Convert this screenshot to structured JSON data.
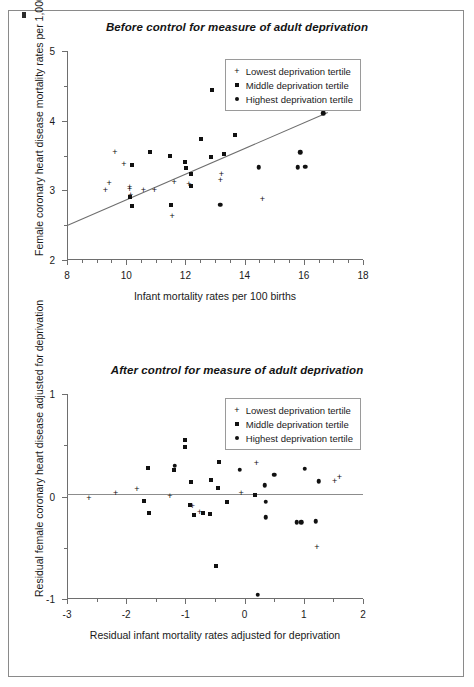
{
  "figure": {
    "background": "#ffffff",
    "border_color": "#8a8a8a",
    "ink_color": "#111111",
    "axis_color": "#6e6e6e"
  },
  "panels": [
    {
      "id": "top",
      "title": "Before control for measure of adult deprivation",
      "xlabel": "Infant mortality rates per 100 births",
      "ylabel": "Female coronary heart disease mortality rates per 1,000",
      "xticks": [
        8,
        10,
        12,
        14,
        16,
        18
      ],
      "yticks": [
        2,
        3,
        4,
        5
      ],
      "xlim": [
        8,
        18
      ],
      "ylim": [
        2,
        5
      ]
    },
    {
      "id": "bottom",
      "title": "After control for measure of adult deprivation",
      "xlabel": "Residual infant mortality rates adjusted for deprivation",
      "ylabel": "Residual female coronary heart disease adjusted for deprivation",
      "xticks": [
        -3,
        -2,
        -1,
        0,
        1,
        2
      ],
      "yticks": [
        1,
        0,
        -1
      ],
      "xlim": [
        -3,
        2
      ],
      "ylim": [
        -1,
        1
      ]
    }
  ],
  "legend": {
    "position": "top-right",
    "entries": [
      {
        "marker": "plus",
        "label": "Lowest deprivation tertile"
      },
      {
        "marker": "square",
        "label": "Middle deprivation tertile"
      },
      {
        "marker": "circle",
        "label": "Highest deprivation tertile"
      }
    ]
  },
  "chart_data": [
    {
      "type": "scatter",
      "panel": "top",
      "title": "Before control for measure of adult deprivation",
      "xlabel": "Infant mortality rates per 100 births",
      "ylabel": "Female coronary heart disease mortality rates per 1,000",
      "xlim": [
        8,
        18
      ],
      "ylim": [
        2,
        5
      ],
      "xticks": [
        8,
        10,
        12,
        14,
        16,
        18
      ],
      "yticks": [
        2,
        3,
        4,
        5
      ],
      "xtick_minor_step": 0.5,
      "ytick_minor_step": 0.5,
      "grid": false,
      "legend_position": "top-right",
      "trendline": {
        "x": [
          8.0,
          16.8
        ],
        "y": [
          2.5,
          4.12
        ]
      },
      "series": [
        {
          "name": "Lowest deprivation tertile",
          "marker": "plus",
          "points": [
            [
              9.3,
              2.99
            ],
            [
              9.42,
              3.09
            ],
            [
              9.62,
              3.54
            ],
            [
              9.92,
              3.37
            ],
            [
              10.12,
              3.04
            ],
            [
              10.12,
              3.0
            ],
            [
              10.15,
              2.92
            ],
            [
              10.58,
              2.99
            ],
            [
              10.95,
              2.99
            ],
            [
              11.55,
              2.62
            ],
            [
              11.62,
              3.11
            ],
            [
              12.12,
              3.07
            ],
            [
              13.22,
              3.22
            ],
            [
              13.18,
              3.14
            ],
            [
              14.6,
              2.86
            ]
          ]
        },
        {
          "name": "Middle deprivation tertile",
          "marker": "square",
          "points": [
            [
              10.12,
              2.9
            ],
            [
              10.2,
              3.36
            ],
            [
              10.18,
              2.77
            ],
            [
              10.82,
              3.55
            ],
            [
              11.48,
              3.5
            ],
            [
              11.52,
              2.79
            ],
            [
              12.0,
              3.4
            ],
            [
              12.02,
              3.32
            ],
            [
              12.18,
              3.23
            ],
            [
              12.2,
              3.06
            ],
            [
              12.52,
              3.74
            ],
            [
              12.88,
              3.48
            ],
            [
              12.9,
              4.44
            ],
            [
              13.32,
              3.52
            ],
            [
              13.68,
              3.8
            ]
          ]
        },
        {
          "name": "Highest deprivation tertile",
          "marker": "circle",
          "points": [
            [
              13.18,
              2.79
            ],
            [
              14.28,
              4.33
            ],
            [
              14.48,
              3.33
            ],
            [
              15.42,
              4.49
            ],
            [
              15.45,
              4.37
            ],
            [
              15.48,
              4.22
            ],
            [
              15.5,
              4.19
            ],
            [
              15.8,
              3.33
            ],
            [
              15.88,
              3.55
            ],
            [
              16.05,
              3.34
            ],
            [
              16.08,
              4.67
            ],
            [
              16.65,
              4.11
            ]
          ]
        }
      ]
    },
    {
      "type": "scatter",
      "panel": "bottom",
      "title": "After control for measure of adult deprivation",
      "xlabel": "Residual infant mortality rates adjusted for deprivation",
      "ylabel": "Residual female coronary heart disease adjusted for deprivation",
      "xlim": [
        -3,
        2
      ],
      "ylim": [
        -1,
        1
      ],
      "xticks": [
        -3,
        -2,
        -1,
        0,
        1,
        2
      ],
      "yticks": [
        1,
        0,
        -1
      ],
      "xtick_minor_step": 0.5,
      "ytick_minor_step": 0.5,
      "grid": false,
      "legend_position": "top-right",
      "zeroline": 0.02,
      "series": [
        {
          "name": "Lowest deprivation tertile",
          "marker": "plus",
          "points": [
            [
              -2.63,
              -0.02
            ],
            [
              -2.18,
              0.02
            ],
            [
              -1.82,
              0.06
            ],
            [
              -1.26,
              0.0
            ],
            [
              -0.88,
              -0.1
            ],
            [
              -0.76,
              -0.16
            ],
            [
              -0.05,
              0.74
            ],
            [
              -0.06,
              0.02
            ],
            [
              0.2,
              0.32
            ],
            [
              1.22,
              -0.5
            ],
            [
              1.52,
              0.14
            ],
            [
              1.6,
              0.18
            ]
          ]
        },
        {
          "name": "Middle deprivation tertile",
          "marker": "square",
          "points": [
            [
              -1.7,
              -0.04
            ],
            [
              -1.64,
              0.28
            ],
            [
              -1.62,
              -0.16
            ],
            [
              -1.19,
              0.26
            ],
            [
              -1.0,
              0.55
            ],
            [
              -1.0,
              0.48
            ],
            [
              -0.9,
              0.14
            ],
            [
              -0.92,
              -0.08
            ],
            [
              -0.86,
              -0.18
            ],
            [
              -0.7,
              -0.16
            ],
            [
              -0.58,
              -0.17
            ],
            [
              -0.56,
              0.16
            ],
            [
              -0.43,
              0.34
            ],
            [
              -0.45,
              0.08
            ],
            [
              -0.48,
              -0.68
            ],
            [
              -0.3,
              -0.05
            ],
            [
              0.18,
              0.01
            ]
          ]
        },
        {
          "name": "Highest deprivation tertile",
          "marker": "circle",
          "points": [
            [
              -1.18,
              0.3
            ],
            [
              -0.08,
              0.26
            ],
            [
              0.22,
              -0.96
            ],
            [
              0.34,
              0.11
            ],
            [
              0.36,
              -0.05
            ],
            [
              0.36,
              -0.2
            ],
            [
              0.5,
              0.21
            ],
            [
              0.88,
              -0.25
            ],
            [
              0.96,
              -0.25
            ],
            [
              1.01,
              0.6
            ],
            [
              1.02,
              0.54
            ],
            [
              1.02,
              0.27
            ],
            [
              1.2,
              -0.24
            ],
            [
              1.25,
              0.15
            ]
          ]
        }
      ]
    }
  ]
}
